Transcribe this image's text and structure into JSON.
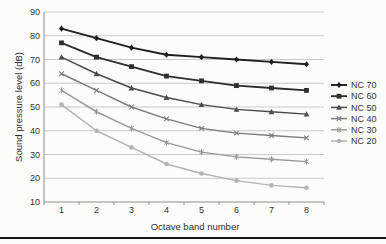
{
  "chart_data": {
    "type": "line",
    "title": "",
    "xlabel": "Octave band number",
    "ylabel": "Sound pressure level (dB)",
    "x_categories": [
      "1",
      "2",
      "3",
      "4",
      "5",
      "6",
      "7",
      "8"
    ],
    "ylim": [
      10,
      90
    ],
    "yticks": [
      10,
      20,
      30,
      40,
      50,
      60,
      70,
      80,
      90
    ],
    "grid": "horizontal",
    "legend_position": "right",
    "series": [
      {
        "name": "NC 70",
        "marker": "diamond",
        "color": "#1f1f1f",
        "values": [
          83,
          79,
          75,
          72,
          71,
          70,
          69,
          68
        ]
      },
      {
        "name": "NC 60",
        "marker": "square",
        "color": "#2e2e2e",
        "values": [
          77,
          71,
          67,
          63,
          61,
          59,
          58,
          57
        ]
      },
      {
        "name": "NC 50",
        "marker": "triangle",
        "color": "#4b4b4b",
        "values": [
          71,
          64,
          58,
          54,
          51,
          49,
          48,
          47
        ]
      },
      {
        "name": "NC 40",
        "marker": "x",
        "color": "#7c7c7c",
        "values": [
          64,
          57,
          50,
          45,
          41,
          39,
          38,
          37
        ]
      },
      {
        "name": "NC 30",
        "marker": "asterisk",
        "color": "#999999",
        "values": [
          57,
          48,
          41,
          35,
          31,
          29,
          28,
          27
        ]
      },
      {
        "name": "NC 20",
        "marker": "circle",
        "color": "#b3b3b3",
        "values": [
          51,
          40,
          33,
          26,
          22,
          19,
          17,
          16
        ]
      }
    ]
  },
  "colors": {
    "background": "#fcfcfb",
    "gridline": "#c4c4c4",
    "axis": "#8f8f8f",
    "tick_label": "#333333",
    "axis_title": "#2e2e2e",
    "footer_rule": "#141414"
  }
}
